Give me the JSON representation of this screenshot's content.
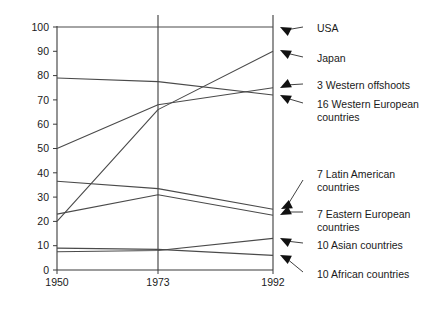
{
  "chart_data": {
    "type": "line",
    "title": "",
    "xlabel": "",
    "ylabel": "",
    "x": [
      1950,
      1973,
      1992
    ],
    "xtick_labels": [
      "1950",
      "1973",
      "1992"
    ],
    "ytick_labels": [
      "0",
      "10",
      "20",
      "30",
      "40",
      "50",
      "60",
      "70",
      "80",
      "90",
      "100"
    ],
    "ytick_values": [
      0,
      10,
      20,
      30,
      40,
      50,
      60,
      70,
      80,
      90,
      100
    ],
    "ylim": [
      0,
      100
    ],
    "grid": false,
    "legend_position": "right-labels-with-arrows",
    "series": [
      {
        "name": "USA",
        "values": [
          100,
          100,
          100
        ]
      },
      {
        "name": "Japan",
        "values": [
          20,
          66,
          90
        ]
      },
      {
        "name": "3 Western offshoots",
        "values": [
          50,
          68,
          75
        ]
      },
      {
        "name": "16 Western European countries",
        "values": [
          79,
          77.5,
          72
        ]
      },
      {
        "name": "7 Latin American countries",
        "values": [
          36.5,
          33.5,
          25
        ]
      },
      {
        "name": "7 Eastern European countries",
        "values": [
          23,
          31,
          22.5
        ]
      },
      {
        "name": "10 Asian countries",
        "values": [
          7.5,
          8,
          13
        ]
      },
      {
        "name": "10 African countries",
        "values": [
          9,
          8.5,
          6
        ]
      }
    ]
  },
  "labels": {
    "usa": "USA",
    "japan": "Japan",
    "western_offshoots": "3 Western offshoots",
    "western_european": "16 Western European\ncountries",
    "latin_american": "7 Latin American\ncountries",
    "eastern_european": "7 Eastern European\ncountries",
    "asian": "10 Asian countries",
    "african": "10 African countries"
  }
}
